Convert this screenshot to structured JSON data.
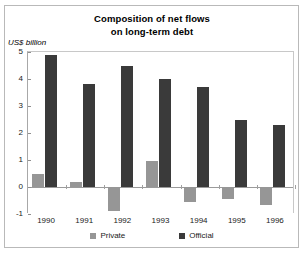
{
  "chart_data": {
    "type": "bar",
    "title": "Composition of net flows on long-term debt",
    "title_line1": "Composition of net flows",
    "title_line2": "on long-term debt",
    "ylabel": "US$ billion",
    "xlabel": "",
    "categories": [
      "1990",
      "1991",
      "1992",
      "1993",
      "1994",
      "1995",
      "1996"
    ],
    "series": [
      {
        "name": "Private",
        "color": "#969696",
        "values": [
          0.5,
          0.2,
          -0.9,
          0.95,
          -0.55,
          -0.45,
          -0.65
        ]
      },
      {
        "name": "Official",
        "color": "#3a3a3a",
        "values": [
          4.9,
          3.8,
          4.5,
          4.0,
          3.7,
          2.5,
          2.3
        ]
      }
    ],
    "ylim": [
      -1,
      5
    ],
    "yticks": [
      5,
      4,
      3,
      2,
      1,
      0,
      "-1"
    ],
    "ytick_values": [
      5,
      4,
      3,
      2,
      1,
      0,
      -1
    ],
    "grid": false,
    "legend_position": "bottom"
  },
  "legend": {
    "entries": [
      {
        "label": "Private",
        "color": "#969696"
      },
      {
        "label": "Official",
        "color": "#3a3a3a"
      }
    ]
  }
}
